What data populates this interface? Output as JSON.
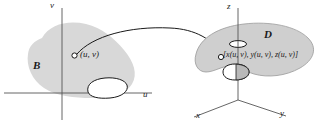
{
  "figure": {
    "caption": "Parametric surface mapping from region B in the uv-plane to surface D in xyz-space",
    "colors": {
      "region_fill": "#d8d8d8",
      "surface_fill": "#cfcfcf",
      "stroke": "#1a1a1a",
      "axis": "#555555",
      "background": "#ffffff"
    }
  },
  "left_panel": {
    "name": "uv-plane",
    "axes": {
      "vertical_label": "v",
      "horizontal_label": "u"
    },
    "region_label": "B",
    "point_label": "(u, v)",
    "point_marker": "open-circle"
  },
  "right_panel": {
    "name": "xyz-space",
    "axes": {
      "vertical_label": "z",
      "left_label": "x",
      "right_label": "y"
    },
    "surface_label": "D",
    "point_label": "[x(u, v), y(u, v), z(u, v)]",
    "point_marker": "open-circle"
  },
  "mapping_arrow": {
    "name": "mapping-arrow",
    "from": "(u, v)",
    "to": "[x(u, v), y(u, v), z(u, v)]",
    "style": "curved-arrow"
  }
}
